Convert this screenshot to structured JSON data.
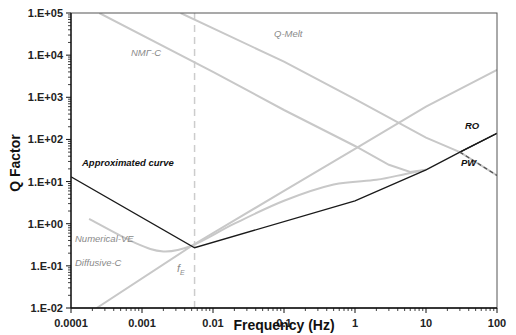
{
  "chart_data": {
    "type": "line",
    "title": "",
    "xlabel": "Frequency (Hz)",
    "ylabel": "Q Factor",
    "xscale": "log",
    "yscale": "log",
    "xlim": [
      0.0001,
      100
    ],
    "ylim": [
      0.01,
      100000
    ],
    "x_ticks": [
      "0.0001",
      "0.001",
      "0.01",
      "0.1",
      "1",
      "10",
      "100"
    ],
    "y_ticks": [
      "1.E-02",
      "1.E-01",
      "1.E+00",
      "1.E+01",
      "1.E+02",
      "1.E+03",
      "1.E+04",
      "1.E+05"
    ],
    "grid": false,
    "legend": "none (inline annotations)",
    "vertical_marker": {
      "label": "f",
      "subscript": "E",
      "x": 0.0055,
      "style": "dashed",
      "color": "#cccccc"
    },
    "series": [
      {
        "name": "Approximated curve",
        "color": "#1a1a1a",
        "style": "solid",
        "points": [
          [
            0.0001,
            13
          ],
          [
            0.0055,
            0.27
          ],
          [
            1,
            3.5
          ],
          [
            10,
            19
          ],
          [
            30,
            50
          ],
          [
            100,
            140
          ]
        ]
      },
      {
        "name": "RO",
        "color": "#1a1a1a",
        "style": "solid",
        "points": [
          [
            30,
            50
          ],
          [
            100,
            140
          ]
        ]
      },
      {
        "name": "PW",
        "color": "#555555",
        "style": "dashed",
        "points": [
          [
            30,
            50
          ],
          [
            100,
            14
          ]
        ]
      },
      {
        "name": "Diffusive-C",
        "color": "#c8c8c8",
        "style": "solid",
        "points": [
          [
            0.00023,
            0.01
          ],
          [
            0.0055,
            0.33
          ],
          [
            0.1,
            6
          ],
          [
            1,
            60
          ],
          [
            10,
            600
          ],
          [
            100,
            4500
          ]
        ]
      },
      {
        "name": "Numerical-VE",
        "color": "#c8c8c8",
        "style": "solid",
        "points": [
          [
            0.00018,
            1.3
          ],
          [
            0.0008,
            0.35
          ],
          [
            0.002,
            0.22
          ],
          [
            0.005,
            0.3
          ],
          [
            0.02,
            1.0
          ],
          [
            0.1,
            3.5
          ],
          [
            0.5,
            8.5
          ],
          [
            2,
            11
          ],
          [
            5,
            15
          ],
          [
            10,
            19
          ]
        ]
      },
      {
        "name": "NMΓ-C",
        "color": "#c8c8c8",
        "style": "solid",
        "points": [
          [
            0.00025,
            100000
          ],
          [
            0.01,
            4000
          ],
          [
            0.1,
            500
          ],
          [
            1,
            70
          ],
          [
            3,
            25
          ],
          [
            6,
            17
          ],
          [
            10,
            19
          ]
        ]
      },
      {
        "name": "Q-Melt",
        "color": "#c8c8c8",
        "style": "solid",
        "points": [
          [
            0.0035,
            100000
          ],
          [
            0.1,
            7000
          ],
          [
            1,
            900
          ],
          [
            10,
            110
          ],
          [
            30,
            50
          ],
          [
            100,
            14
          ]
        ]
      }
    ],
    "annotations": [
      {
        "text": "NMΓ-C",
        "x": 0.0007,
        "y": 15000
      },
      {
        "text": "Q-Melt",
        "x": 0.15,
        "y": 60000
      },
      {
        "text": "Approximated curve",
        "x": 0.00013,
        "y": 20
      },
      {
        "text": "Numerical-VE",
        "x": 0.00012,
        "y": 0.18
      },
      {
        "text": "Diffusive-C",
        "x": 0.00012,
        "y": 0.06
      },
      {
        "text": "RO",
        "x": 40,
        "y": 100
      },
      {
        "text": "PW",
        "x": 38,
        "y": 16
      }
    ]
  },
  "labels": {
    "xlabel": "Frequency (Hz)",
    "ylabel": "Q Factor",
    "approximated": "Approximated curve",
    "numerical_ve": "Numerical-VE",
    "diffusive_c": "Diffusive-C",
    "nmgc": "NMΓ-C",
    "qmelt": "Q-Melt",
    "ro": "RO",
    "pw": "PW",
    "fe": "f",
    "fe_sub": "E"
  }
}
